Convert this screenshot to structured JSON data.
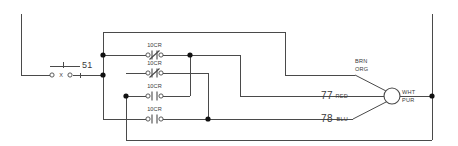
{
  "diagram": {
    "background_color": "#ffffff",
    "line_color": "#4a4a4a",
    "node_color": "#111111",
    "switch": {
      "designation": "51",
      "type": "selector-switch",
      "marker": "X"
    },
    "contacts": [
      {
        "id": "contact-1",
        "label": "10CR",
        "state": "normally-closed"
      },
      {
        "id": "contact-2",
        "label": "10CR",
        "state": "normally-closed"
      },
      {
        "id": "contact-3",
        "label": "10CR",
        "state": "normally-open"
      },
      {
        "id": "contact-4",
        "label": "10CR",
        "state": "normally-open"
      }
    ],
    "terminals": [
      {
        "number": "77",
        "wire_color": "RED"
      },
      {
        "number": "78",
        "wire_color": "BLU"
      }
    ],
    "connector": {
      "name": "plug-connector",
      "top_wire_line1": "BRN",
      "top_wire_line2": "ORG",
      "out_wire_line1": "WHT",
      "out_wire_line2": "PUR"
    }
  }
}
